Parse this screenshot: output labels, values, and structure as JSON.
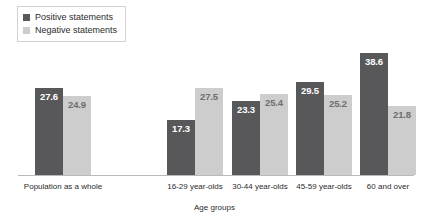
{
  "chart_data": {
    "type": "bar",
    "title": "",
    "xlabel": "Age groups",
    "ylabel": "",
    "ylim": [
      0,
      42
    ],
    "grid": false,
    "legend_position": "top-left",
    "categories": [
      "Population as a whole",
      "16-29 year-olds",
      "30-44 year-olds",
      "45-59 year-olds",
      "60 and over"
    ],
    "series": [
      {
        "name": "Positive statements",
        "color": "#58585a",
        "values": [
          27.6,
          17.3,
          23.3,
          29.5,
          38.6
        ]
      },
      {
        "name": "Negative statements",
        "color": "#cdcdcd",
        "values": [
          24.9,
          27.5,
          25.4,
          25.2,
          21.8
        ]
      }
    ]
  },
  "legend": {
    "items": [
      {
        "label": "Positive statements",
        "color": "#58585a"
      },
      {
        "label": "Negative statements",
        "color": "#cdcdcd"
      }
    ]
  },
  "axis": {
    "title": "Age groups"
  }
}
